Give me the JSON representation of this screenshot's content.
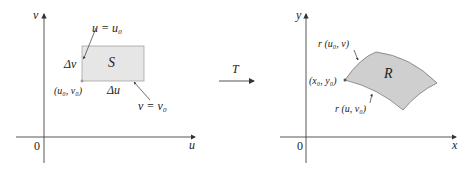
{
  "left_plane": {
    "axis_x_label": "u",
    "axis_y_label": "v",
    "origin_label": "0",
    "region_label": "S",
    "line_u_label": "u = u₀",
    "line_v_label": "v = v₀",
    "delta_u": "Δu",
    "delta_v": "Δv",
    "corner_label": "(u₀, v₀)",
    "region_fill": "#e6e6e6"
  },
  "transform": {
    "label": "T"
  },
  "right_plane": {
    "axis_x_label": "x",
    "axis_y_label": "y",
    "origin_label": "0",
    "region_label": "R",
    "curve_top_label": "r (u₀, v)",
    "curve_bottom_label": "r (u, v₀)",
    "corner_label": "(x₀, y₀)",
    "region_fill": "#cfcfcf"
  }
}
